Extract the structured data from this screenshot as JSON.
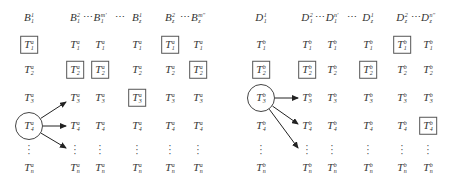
{
  "left_panel": {
    "headers": [
      {
        "base": "B",
        "sup": "1",
        "sub": "1"
      },
      {
        "base": "B",
        "sup": "2",
        "sub": "1"
      },
      {
        "base": "B",
        "sup": "m'",
        "sub": "1"
      },
      {
        "base": "B",
        "sup": "1",
        "sub": "z"
      },
      {
        "base": "B",
        "sup": "2",
        "sub": "z"
      },
      {
        "base": "B",
        "sup": "m''",
        "sub": "z"
      }
    ],
    "header_ellipsis": [
      "⋯",
      "⋯",
      "⋯"
    ],
    "cell_superscript": "a",
    "row_subscripts": [
      "1",
      "2",
      "3",
      "4",
      "⋮",
      "n"
    ],
    "boxed_cells": [
      [
        0,
        0
      ],
      [
        0,
        4
      ],
      [
        1,
        1
      ],
      [
        1,
        2
      ],
      [
        1,
        5
      ],
      [
        2,
        3
      ]
    ],
    "circled_cell": [
      3,
      0
    ],
    "arrow_targets": [
      [
        2,
        1
      ],
      [
        3,
        1
      ],
      [
        4,
        1
      ]
    ]
  },
  "right_panel": {
    "headers": [
      {
        "base": "D",
        "sup": "1",
        "sub": "1"
      },
      {
        "base": "D",
        "sup": "2",
        "sub": "1"
      },
      {
        "base": "D",
        "sup": "n'",
        "sub": "1"
      },
      {
        "base": "D",
        "sup": "1",
        "sub": "z"
      },
      {
        "base": "D",
        "sup": "2",
        "sub": "z"
      },
      {
        "base": "D",
        "sup": "n''",
        "sub": "z"
      }
    ],
    "header_ellipsis": [
      "⋯",
      "⋯",
      "⋯"
    ],
    "cell_superscript": "b",
    "row_subscripts": [
      "1",
      "2",
      "3",
      "4",
      "⋮",
      "n"
    ],
    "boxed_cells": [
      [
        0,
        4
      ],
      [
        1,
        0
      ],
      [
        1,
        1
      ],
      [
        1,
        3
      ],
      [
        3,
        5
      ]
    ],
    "circled_cell": [
      2,
      0
    ],
    "arrow_targets": [
      [
        2,
        1
      ],
      [
        3,
        1
      ],
      [
        4,
        1
      ]
    ]
  },
  "cell_base": "T",
  "colors": {
    "ink": "#333333",
    "border": "#555555"
  }
}
